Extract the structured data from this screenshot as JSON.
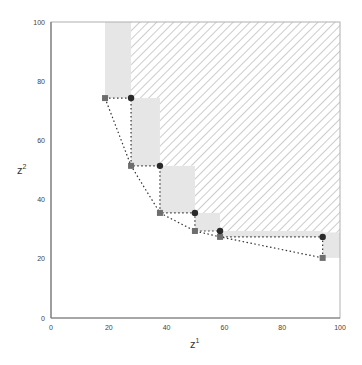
{
  "chart_data": {
    "type": "scatter",
    "title": "",
    "xlabel": "z",
    "xlabel_sup": "1",
    "ylabel": "z",
    "ylabel_sup": "2",
    "xlim": [
      0,
      100
    ],
    "ylim": [
      0,
      100
    ],
    "grid": false,
    "legend": "none",
    "xticks": [
      "0",
      "20",
      "40",
      "60",
      "80",
      "100"
    ],
    "yticks": [
      "0",
      "20",
      "40",
      "60",
      "80",
      "100"
    ],
    "series": [
      {
        "name": "squares (lower front)",
        "marker": "square",
        "color": "#6e6e6e",
        "points": [
          [
            18.7,
            74.3
          ],
          [
            27.7,
            51.4
          ],
          [
            37.7,
            35.5
          ],
          [
            49.8,
            29.4
          ],
          [
            58.5,
            27.4
          ],
          [
            94.0,
            20.3
          ]
        ]
      },
      {
        "name": "circles (upper front)",
        "marker": "circle",
        "color": "#2a2a2a",
        "points": [
          [
            27.7,
            74.3
          ],
          [
            37.7,
            51.4
          ],
          [
            49.8,
            35.5
          ],
          [
            58.5,
            29.4
          ],
          [
            94.0,
            27.4
          ]
        ]
      }
    ],
    "regions": {
      "hatched": "dominated region above/right of circle staircase",
      "gray_boxes": "regions between square front and circle front"
    },
    "colors": {
      "gray_fill": "#e6e6e6",
      "hatch": "#9a9a9a",
      "axis": "#888888",
      "dotted_line": "#333333"
    }
  }
}
